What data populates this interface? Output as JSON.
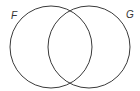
{
  "diagram": {
    "type": "venn",
    "sets": [
      {
        "label": "F",
        "cx": 51,
        "cy": 47,
        "r": 41
      },
      {
        "label": "G",
        "cx": 89,
        "cy": 47,
        "r": 41
      }
    ],
    "stroke_color": "#3a3a3a"
  }
}
